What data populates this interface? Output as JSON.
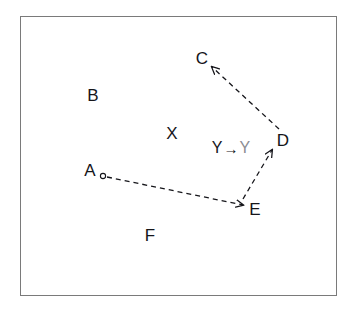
{
  "figure": {
    "background_color": "#ffffff",
    "frame": {
      "border_color": "#7a7a7a",
      "fill_color": "#ffffff"
    },
    "ink_color": "#15151a",
    "faded_ink_color": "#8d8d93"
  },
  "nodes": [
    {
      "id": "C",
      "label": "C",
      "x": 202,
      "y": 58
    },
    {
      "id": "B",
      "label": "B",
      "x": 93,
      "y": 95
    },
    {
      "id": "X",
      "label": "X",
      "x": 172,
      "y": 133
    },
    {
      "id": "D",
      "label": "D",
      "x": 283,
      "y": 140
    },
    {
      "id": "A",
      "label": "A",
      "x": 90,
      "y": 170
    },
    {
      "id": "E",
      "label": "E",
      "x": 255,
      "y": 209
    },
    {
      "id": "F",
      "label": "F",
      "x": 150,
      "y": 235
    }
  ],
  "markers": [
    {
      "id": "A-marker",
      "shape": "circle",
      "x": 103,
      "y": 176,
      "r": 2.6
    }
  ],
  "transition": {
    "from_label": "Y",
    "arrow_glyph": "→",
    "to_label": "Y",
    "x": 231,
    "y": 148
  },
  "edges": [
    {
      "id": "A-to-E",
      "from": "A",
      "to": "E",
      "style": "dashed",
      "arrowhead": "end",
      "x1": 107,
      "y1": 177,
      "x2": 243,
      "y2": 205
    },
    {
      "id": "E-to-D",
      "from": "E",
      "to": "D",
      "style": "dashed",
      "arrowhead": "end",
      "x1": 243,
      "y1": 199,
      "x2": 272,
      "y2": 150
    },
    {
      "id": "D-to-C",
      "from": "D",
      "to": "C",
      "style": "dashed",
      "arrowhead": "end",
      "x1": 279,
      "y1": 129,
      "x2": 212,
      "y2": 67
    }
  ]
}
